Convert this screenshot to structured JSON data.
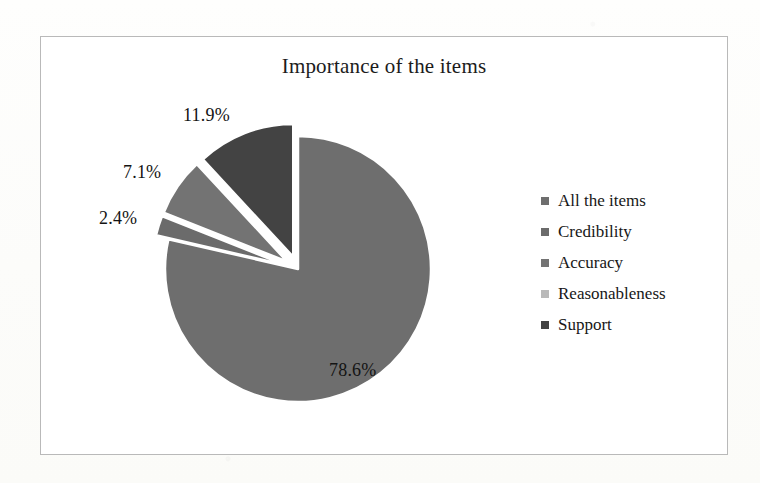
{
  "page": {
    "background_color": "#fdfdfb",
    "frame_border_color": "#b9b9b9"
  },
  "chart_data": {
    "type": "pie",
    "title": "Importance of the items",
    "xlabel": "",
    "ylabel": "",
    "categories": [
      "All the items",
      "Credibility",
      "Accuracy",
      "Reasonableness",
      "Support"
    ],
    "values": [
      78.6,
      2.4,
      7.1,
      0.0,
      11.9
    ],
    "value_labels": [
      "78.6%",
      "2.4%",
      "7.1%",
      "",
      "11.9%"
    ],
    "unit": "%",
    "legend_position": "right",
    "grid": false,
    "colors": [
      "#6e6e6e",
      "#6b6b6b",
      "#737373",
      "#b9b9b9",
      "#434343"
    ],
    "slices": [
      {
        "name": "All the items",
        "value": 78.6,
        "label": "78.6%",
        "color": "#6e6e6e",
        "exploded": false
      },
      {
        "name": "Credibility",
        "value": 2.4,
        "label": "2.4%",
        "color": "#6b6b6b",
        "exploded": true
      },
      {
        "name": "Accuracy",
        "value": 7.1,
        "label": "7.1%",
        "color": "#737373",
        "exploded": true
      },
      {
        "name": "Reasonableness",
        "value": 0.0,
        "label": "",
        "color": "#b9b9b9",
        "exploded": false
      },
      {
        "name": "Support",
        "value": 11.9,
        "label": "11.9%",
        "color": "#434343",
        "exploded": true
      }
    ]
  },
  "labels": {
    "l1": "11.9%",
    "l2": "7.1%",
    "l3": "2.4%",
    "l4": "78.6%"
  },
  "legend": {
    "items": [
      {
        "label": "All the items",
        "color": "#6e6e6e"
      },
      {
        "label": "Credibility",
        "color": "#6b6b6b"
      },
      {
        "label": "Accuracy",
        "color": "#737373"
      },
      {
        "label": "Reasonableness",
        "color": "#b9b9b9"
      },
      {
        "label": "Support",
        "color": "#434343"
      }
    ]
  }
}
